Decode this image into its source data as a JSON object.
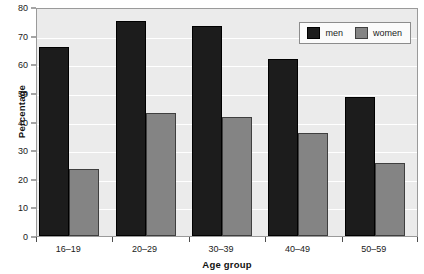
{
  "chart_data": {
    "type": "bar",
    "title": "",
    "subtitle": "",
    "xlabel": "Age group",
    "ylabel": "Percentage",
    "categories": [
      "16–19",
      "20–29",
      "30–39",
      "40–49",
      "50–59"
    ],
    "series": [
      {
        "name": "men",
        "color": "#1c1c1c",
        "values": [
          66,
          75,
          73.5,
          62,
          48.5
        ]
      },
      {
        "name": "women",
        "color": "#848484",
        "values": [
          23.5,
          43,
          41.5,
          36,
          25.5
        ]
      }
    ],
    "ylim": [
      0,
      80
    ],
    "ytick_values": [
      0,
      10,
      20,
      30,
      40,
      50,
      60,
      70,
      80
    ],
    "ytick_labels": [
      "0",
      "10",
      "20",
      "30",
      "40",
      "50",
      "60",
      "70",
      "80"
    ],
    "grid": true,
    "grid_axis": "y",
    "legend_position": "top-right-inside",
    "plot_background": "#ebebeb",
    "figure_background": "#ffffff"
  },
  "legend": {
    "entries": [
      {
        "label": "men",
        "swatch": "men-swatch"
      },
      {
        "label": "women",
        "swatch": "women-swatch"
      }
    ]
  }
}
